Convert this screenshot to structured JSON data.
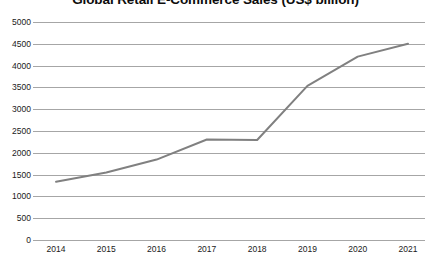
{
  "chart_data": {
    "type": "line",
    "title": "Global Retail E-Commerce Sales (US$ billion)",
    "xlabel": "",
    "ylabel": "",
    "categories": [
      "2014",
      "2015",
      "2016",
      "2017",
      "2018",
      "2019",
      "2020",
      "2021"
    ],
    "values": [
      1336,
      1548,
      1845,
      2304,
      2294,
      3535,
      4206,
      4500
    ],
    "series": [
      {
        "name": "Global Retail E-Commerce Sales",
        "values": [
          1336,
          1548,
          1845,
          2304,
          2294,
          3535,
          4206,
          4500
        ]
      }
    ],
    "ylim": [
      0,
      5000
    ],
    "ytick_labels": [
      "5000",
      "4500",
      "4000",
      "3500",
      "3000",
      "2500",
      "2000",
      "1500",
      "1000",
      "500",
      "0"
    ],
    "ytick_values": [
      5000,
      4500,
      4000,
      3500,
      3000,
      2500,
      2000,
      1500,
      1000,
      500,
      0
    ],
    "grid": true,
    "legend": false,
    "legend_position": "none",
    "markers": false,
    "line_color": "#808080",
    "gridline_color": "#a6a6a6",
    "background_color": "#ffffff",
    "title_color": "#0d0d0d"
  }
}
